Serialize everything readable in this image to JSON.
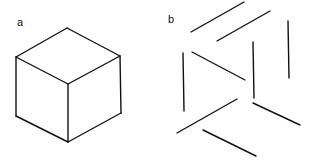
{
  "figure": {
    "panels": [
      {
        "label": "a",
        "description": "Complete line drawing of a cube in isometric view",
        "stroke_color": "#111111",
        "segments": [
          [
            67,
            28,
            16,
            57
          ],
          [
            67,
            28,
            120,
            56
          ],
          [
            16,
            57,
            68,
            84
          ],
          [
            120,
            56,
            68,
            84
          ],
          [
            16,
            57,
            16,
            116
          ],
          [
            120,
            56,
            121,
            113
          ],
          [
            68,
            84,
            68,
            142
          ],
          [
            16,
            116,
            68,
            142
          ],
          [
            121,
            113,
            68,
            142
          ]
        ]
      },
      {
        "label": "b",
        "description": "Fragmented, disconnected line segments of the cube edges",
        "stroke_color": "#111111",
        "segments": [
          [
            191,
            32,
            244,
            2
          ],
          [
            217,
            41,
            270,
            11
          ],
          [
            192,
            52,
            245,
            80
          ],
          [
            183,
            53,
            184,
            111
          ],
          [
            253,
            42,
            254,
            98
          ],
          [
            288,
            21,
            289,
            78
          ],
          [
            177,
            133,
            237,
            99
          ],
          [
            253,
            103,
            300,
            125
          ],
          [
            203,
            130,
            256,
            156
          ]
        ]
      }
    ]
  }
}
